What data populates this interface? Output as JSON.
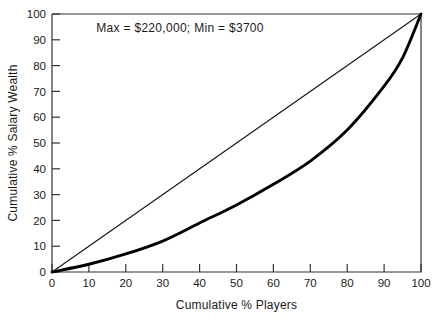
{
  "chart_data": {
    "type": "line",
    "title": "",
    "subtitle": "",
    "xlabel": "Cumulative % Players",
    "ylabel": "Cumulative % Salary Wealth",
    "xlim": [
      0,
      100
    ],
    "ylim": [
      0,
      100
    ],
    "grid": false,
    "legend_position": "none",
    "x_ticks": [
      "0",
      "10",
      "20",
      "30",
      "40",
      "50",
      "60",
      "70",
      "80",
      "90",
      "100"
    ],
    "y_ticks": [
      "0",
      "10",
      "20",
      "30",
      "40",
      "50",
      "60",
      "70",
      "80",
      "90",
      "100"
    ],
    "x_tick_values": [
      0,
      10,
      20,
      30,
      40,
      50,
      60,
      70,
      80,
      90,
      100
    ],
    "y_tick_values": [
      0,
      10,
      20,
      30,
      40,
      50,
      60,
      70,
      80,
      90,
      100
    ],
    "annotations": [
      {
        "text": "Max  =  $220,000;  Min  =  $3700",
        "x": 12,
        "y": 93
      }
    ],
    "series": [
      {
        "name": "Line of equality",
        "style": "thin",
        "x": [
          0,
          100
        ],
        "values": [
          0,
          100
        ]
      },
      {
        "name": "Lorenz curve",
        "style": "thick",
        "x": [
          0,
          10,
          20,
          30,
          40,
          50,
          60,
          70,
          80,
          90,
          95,
          100
        ],
        "values": [
          0,
          3,
          7,
          12,
          19,
          26,
          34,
          43,
          55,
          72,
          83,
          100
        ]
      }
    ]
  },
  "annotation": {
    "max_min_text": "Max  =  $220,000;  Min  =  $3700"
  },
  "axes": {
    "x_title": "Cumulative % Players",
    "y_title": "Cumulative % Salary Wealth"
  },
  "colors": {
    "background": "#ffffff",
    "frame": "#333333",
    "lorenz": "#000000",
    "equality": "#111111",
    "text": "#1a1a1a"
  }
}
